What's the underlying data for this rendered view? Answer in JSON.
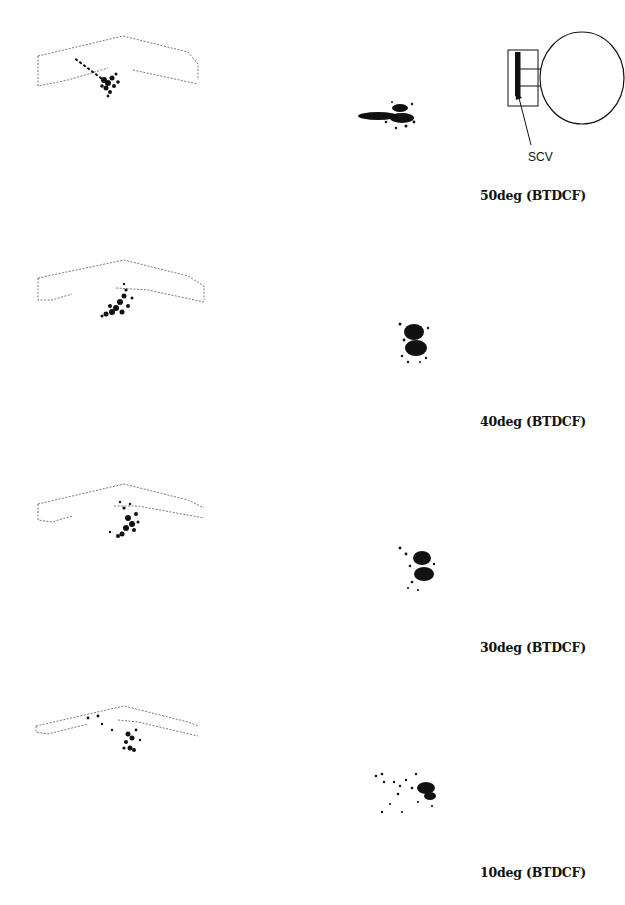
{
  "figure": {
    "schematic": {
      "label": "SCV",
      "icon": "cylinder-port-schematic-icon"
    },
    "rows": [
      {
        "caption": "50deg (BTDCF)",
        "crank_angle_deg": 50,
        "reference": "BTDCF"
      },
      {
        "caption": "40deg (BTDCF)",
        "crank_angle_deg": 40,
        "reference": "BTDCF"
      },
      {
        "caption": "30deg (BTDCF)",
        "crank_angle_deg": 30,
        "reference": "BTDCF"
      },
      {
        "caption": "10deg (BTDCF)",
        "crank_angle_deg": 10,
        "reference": "BTDCF"
      }
    ],
    "colors": {
      "ink": "#111111",
      "background": "#ffffff",
      "faint": "#9a9a9a"
    }
  }
}
